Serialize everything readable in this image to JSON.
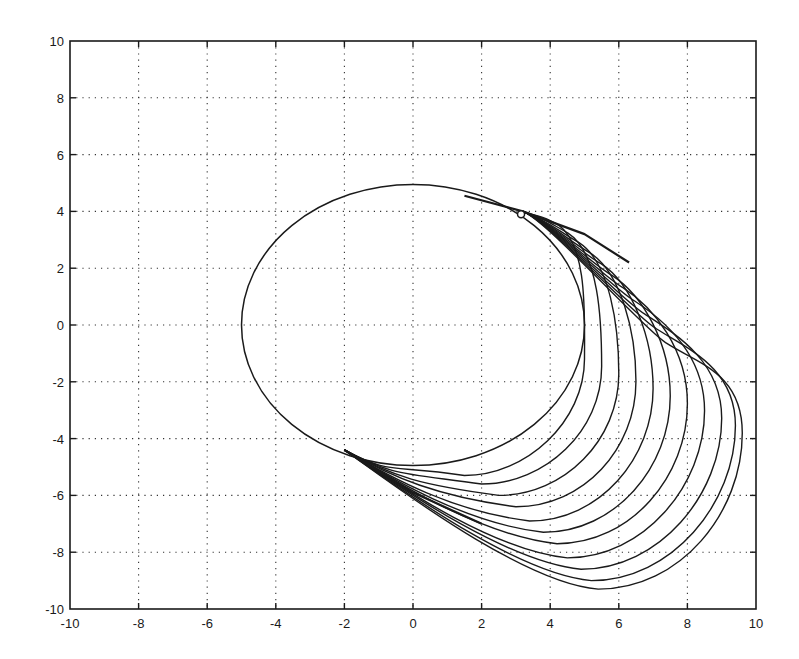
{
  "chart_data": {
    "type": "line",
    "title": "",
    "xlabel": "",
    "ylabel": "",
    "xlim": [
      -10,
      10
    ],
    "ylim": [
      -10,
      10
    ],
    "grid": true,
    "grid_style": "dotted",
    "legend": null,
    "xticks": [
      -10,
      -8,
      -6,
      -4,
      -2,
      0,
      2,
      4,
      6,
      8,
      10
    ],
    "yticks": [
      -10,
      -8,
      -6,
      -4,
      -2,
      0,
      2,
      4,
      6,
      8,
      10
    ],
    "xtick_labels": [
      "-10",
      "-8",
      "-6",
      "-4",
      "-2",
      "0",
      "2",
      "4",
      "6",
      "8",
      "10"
    ],
    "ytick_labels": [
      "-10",
      "-8",
      "-6",
      "-4",
      "-2",
      "0",
      "2",
      "4",
      "6",
      "8",
      "10"
    ],
    "line_color": "#1a1a1a",
    "ellipse": {
      "cx": 0,
      "cy": 0,
      "rx": 5.0,
      "ry": 4.95
    },
    "start_marker": {
      "x": 3.15,
      "y": 3.9,
      "shape": "circle"
    },
    "upper_envelope": [
      [
        1.5,
        4.55
      ],
      [
        3.2,
        4.0
      ],
      [
        5.0,
        3.2
      ],
      [
        6.3,
        2.2
      ],
      [
        7.2,
        0.6
      ],
      [
        8.6,
        -1.6
      ],
      [
        9.4,
        -3.3
      ]
    ],
    "lower_envelope": [
      [
        -2.0,
        -4.4
      ],
      [
        0.0,
        -5.9
      ],
      [
        2.0,
        -7.0
      ],
      [
        4.0,
        -8.1
      ],
      [
        5.4,
        -9.2
      ]
    ],
    "trajectories": [
      {
        "right_x_at_y0": 4.9,
        "max_x": 5.0,
        "bottom": [
          1.5,
          -5.3
        ]
      },
      {
        "right_x_at_y0": 5.3,
        "max_x": 5.5,
        "bottom": [
          2.0,
          -5.6
        ]
      },
      {
        "right_x_at_y0": 5.8,
        "max_x": 6.0,
        "bottom": [
          2.5,
          -6.0
        ]
      },
      {
        "right_x_at_y0": 6.2,
        "max_x": 6.5,
        "bottom": [
          3.0,
          -6.4
        ]
      },
      {
        "right_x_at_y0": 6.6,
        "max_x": 7.0,
        "bottom": [
          3.4,
          -6.9
        ]
      },
      {
        "right_x_at_y0": 6.9,
        "max_x": 7.5,
        "bottom": [
          3.8,
          -7.3
        ]
      },
      {
        "right_x_at_y0": 7.2,
        "max_x": 8.0,
        "bottom": [
          4.2,
          -7.7
        ]
      },
      {
        "right_x_at_y0": 7.6,
        "max_x": 8.5,
        "bottom": [
          4.5,
          -8.2
        ]
      },
      {
        "right_x_at_y0": 7.9,
        "max_x": 9.0,
        "bottom": [
          4.9,
          -8.6
        ]
      },
      {
        "right_x_at_y0": 8.3,
        "max_x": 9.4,
        "bottom": [
          5.2,
          -9.0
        ]
      },
      {
        "right_x_at_y0": 8.6,
        "max_x": 9.6,
        "bottom": [
          5.4,
          -9.3
        ]
      }
    ]
  }
}
